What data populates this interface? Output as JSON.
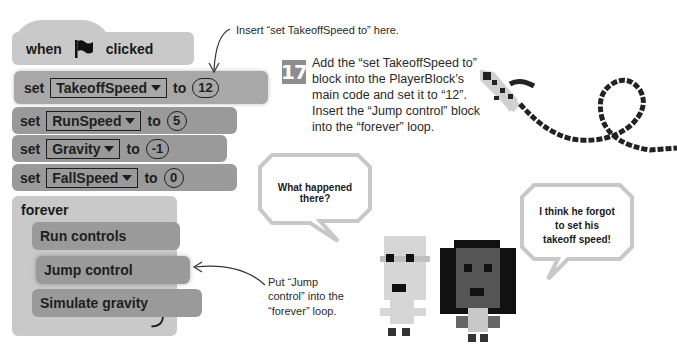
{
  "script": {
    "hat": {
      "when": "when",
      "flag_icon": "green-flag-icon",
      "clicked": "clicked"
    },
    "set_blocks": [
      {
        "set": "set",
        "variable": "TakeoffSpeed",
        "to": "to",
        "value": "12"
      },
      {
        "set": "set",
        "variable": "RunSpeed",
        "to": "to",
        "value": "5"
      },
      {
        "set": "set",
        "variable": "Gravity",
        "to": "to",
        "value": "-1"
      },
      {
        "set": "set",
        "variable": "FallSpeed",
        "to": "to",
        "value": "0"
      }
    ],
    "forever": {
      "label": "forever",
      "inner_blocks": [
        "Run controls",
        "Jump control",
        "Simulate gravity"
      ],
      "loop_icon": "loop-arrow-icon"
    }
  },
  "callouts": {
    "top": "Insert “set TakeoffSpeed to” here.",
    "jump_line1": "Put “Jump",
    "jump_line2": "control” into the",
    "jump_line3": "“forever” loop."
  },
  "step": {
    "number": "17",
    "text": "Add the “set TakeoffSpeed to” block into the PlayerBlock’s main code and set it to “12”. Insert the “Jump control” block into the “forever” loop."
  },
  "bubbles": {
    "left_line1": "What happened",
    "left_line2": "there?",
    "right_line1": "I think he forgot",
    "right_line2": "to set his",
    "right_line3": "takeoff speed!"
  },
  "colors": {
    "block_light": "#c9c9c9",
    "block_mid": "#a8a8a8",
    "block_dark": "#9a9a9a",
    "step_badge": "#8d8d8d"
  }
}
